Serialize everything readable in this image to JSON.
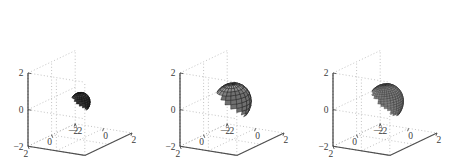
{
  "figure": {
    "background": "#ffffff",
    "panel_count": 3,
    "axis_color": "#4d4d4d",
    "grid_color": "#9a9a9a",
    "tick_color": "#3a3a3a"
  },
  "chart_data": [
    {
      "type": "scatter",
      "subtype": "surface-3d-sphere",
      "panel_index": 0,
      "title": "",
      "xlabel": "",
      "ylabel": "",
      "zlabel": "",
      "xlim": [
        -2,
        2
      ],
      "ylim": [
        -2,
        2
      ],
      "zlim": [
        -2,
        2
      ],
      "xticks": [
        -2,
        0,
        2
      ],
      "yticks": [
        -2,
        0,
        2
      ],
      "zticks": [
        -2,
        0,
        2
      ],
      "xticklabels": [
        "-2",
        "0",
        "2"
      ],
      "yticklabels": [
        "2",
        "0",
        "-2"
      ],
      "zticklabels": [
        "-2",
        "0",
        "2"
      ],
      "grid": true,
      "legend": false,
      "sphere": {
        "center": [
          0,
          0,
          0
        ],
        "radius": 0.55,
        "meridians": 20,
        "parallels": 14,
        "facecolor_light": "#8c8c8c",
        "facecolor_dark": "#1d1d1d",
        "edgecolor": "#111111",
        "shading": "dark"
      }
    },
    {
      "type": "scatter",
      "subtype": "surface-3d-sphere",
      "panel_index": 1,
      "title": "",
      "xlabel": "",
      "ylabel": "",
      "zlabel": "",
      "xlim": [
        -2,
        2
      ],
      "ylim": [
        -2,
        2
      ],
      "zlim": [
        -2,
        2
      ],
      "xticks": [
        -2,
        0,
        2
      ],
      "yticks": [
        -2,
        0,
        2
      ],
      "zticks": [
        -2,
        0,
        2
      ],
      "xticklabels": [
        "-2",
        "0",
        "2"
      ],
      "yticklabels": [
        "2",
        "0",
        "-2"
      ],
      "zticklabels": [
        "-2",
        "0",
        "2"
      ],
      "grid": true,
      "legend": false,
      "sphere": {
        "center": [
          0,
          0,
          0
        ],
        "radius": 1.05,
        "meridians": 20,
        "parallels": 14,
        "facecolor_light": "#d0d0d0",
        "facecolor_dark": "#5a5a5a",
        "edgecolor": "#1a1a1a",
        "shading": "gouraud"
      }
    },
    {
      "type": "scatter",
      "subtype": "surface-3d-sphere",
      "panel_index": 2,
      "title": "",
      "xlabel": "",
      "ylabel": "",
      "zlabel": "",
      "xlim": [
        -2,
        2
      ],
      "ylim": [
        -2,
        2
      ],
      "zlim": [
        -2,
        2
      ],
      "xticks": [
        -2,
        0,
        2
      ],
      "yticks": [
        -2,
        0,
        2
      ],
      "zticks": [
        -2,
        0,
        2
      ],
      "xticklabels": [
        "-2",
        "0",
        "2"
      ],
      "yticklabels": [
        "2",
        "0",
        "-2"
      ],
      "zticklabels": [
        "-2",
        "0",
        "2"
      ],
      "grid": true,
      "legend": false,
      "sphere": {
        "center": [
          0,
          0,
          0
        ],
        "radius": 1.0,
        "meridians": 34,
        "parallels": 24,
        "facecolor_light": "#b8b8b8",
        "facecolor_dark": "#707070",
        "edgecolor": "#2b2b2b",
        "shading": "fine-mesh"
      }
    }
  ]
}
